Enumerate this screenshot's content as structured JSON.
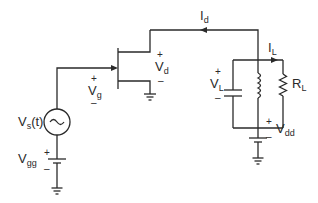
{
  "diagram": {
    "type": "circuit-schematic",
    "colors": {
      "line": "#2a2a2a",
      "background": "#ffffff"
    },
    "components": {
      "source": {
        "name": "V",
        "sub": "s",
        "suffix": "(t)",
        "symbol": "~"
      },
      "gate_bias": {
        "name": "V",
        "sub": "gg",
        "plus": "+",
        "minus": "–"
      },
      "gate_voltage": {
        "name": "V",
        "sub": "g",
        "plus": "+",
        "minus": "–"
      },
      "drain_voltage": {
        "name": "V",
        "sub": "d",
        "plus": "+",
        "minus": "–"
      },
      "drain_current": {
        "name": "I",
        "sub": "d"
      },
      "load_current": {
        "name": "I",
        "sub": "L"
      },
      "load_voltage": {
        "name": "V",
        "sub": "L",
        "plus": "+",
        "minus": "–"
      },
      "load_resistor": {
        "name": "R",
        "sub": "L"
      },
      "drain_supply": {
        "name": "V",
        "sub": "dd",
        "plus": "+",
        "minus": "–"
      }
    }
  }
}
